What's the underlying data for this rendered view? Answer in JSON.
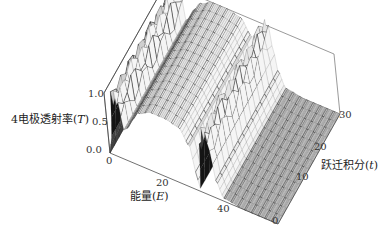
{
  "chart_data": {
    "type": "surface3d",
    "title": "",
    "zlabel": "4电极透射率(T)",
    "xlabel": "能量(E)",
    "ylabel": "跃迁积分(t)",
    "z_ticks": [
      "0.0",
      "0.5",
      "1.0"
    ],
    "x_ticks": [
      "0",
      "20",
      "40"
    ],
    "y_ticks": [
      "0",
      "10",
      "20",
      "30"
    ],
    "x_range": [
      0,
      50
    ],
    "y_range": [
      0,
      35
    ],
    "z_range": [
      0,
      1
    ],
    "profile_along_E": {
      "E": [
        0,
        1,
        2,
        3,
        4,
        5,
        6,
        8,
        10,
        14,
        18,
        22,
        25,
        26,
        27,
        28,
        29,
        30,
        31,
        32,
        34,
        40,
        50
      ],
      "T": [
        0.0,
        0.3,
        0.95,
        1.0,
        0.9,
        0.5,
        0.55,
        0.75,
        0.9,
        1.0,
        1.0,
        0.95,
        0.7,
        0.3,
        0.05,
        0.7,
        1.0,
        1.0,
        0.8,
        0.3,
        0.05,
        0.0,
        0.0
      ]
    },
    "mesh": true,
    "box": true
  },
  "labels": {
    "z_axis": "4电极透射率",
    "z_sym": "T",
    "x_axis": "能量",
    "x_sym": "E",
    "y_axis": "跃迁积分",
    "y_sym": "t"
  }
}
